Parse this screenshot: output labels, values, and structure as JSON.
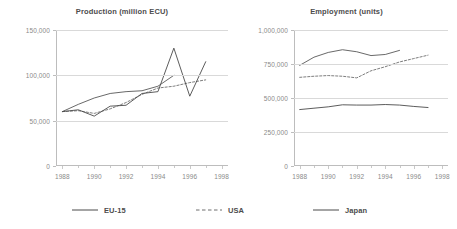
{
  "chart_data": [
    {
      "type": "line",
      "title": "Production (million ECU)",
      "xlabel": "",
      "ylabel": "",
      "x": [
        1988,
        1989,
        1990,
        1991,
        1992,
        1993,
        1994,
        1995,
        1996,
        1997
      ],
      "xlim": [
        1987.6,
        1998.4
      ],
      "ylim": [
        0,
        150000
      ],
      "xticks": [
        1988,
        1990,
        1992,
        1994,
        1996,
        1998
      ],
      "xticklabels": [
        "1988",
        "1990",
        "1992",
        "1994",
        "1996",
        "1998"
      ],
      "yticks": [
        0,
        50000,
        100000,
        150000
      ],
      "yticklabels": [
        "0",
        "50,000",
        "100,000",
        "150,000"
      ],
      "grid": true,
      "legend_position": "bottom",
      "series": [
        {
          "name": "EU-15",
          "style": "solid",
          "color": "#585858",
          "values": [
            60000,
            68000,
            75000,
            80000,
            82000,
            83000,
            88000,
            100000,
            null,
            null
          ]
        },
        {
          "name": "USA",
          "style": "dashed",
          "color": "#6e6e6e",
          "values": [
            60000,
            61000,
            58000,
            63000,
            70000,
            79000,
            86000,
            88000,
            92000,
            95000
          ]
        },
        {
          "name": "Japan",
          "style": "solid",
          "color": "#4a4a4a",
          "values": [
            60000,
            62000,
            55000,
            66000,
            67000,
            80000,
            82000,
            130000,
            77000,
            115000
          ]
        }
      ]
    },
    {
      "type": "line",
      "title": "Employment (units)",
      "xlabel": "",
      "ylabel": "",
      "x": [
        1988,
        1989,
        1990,
        1991,
        1992,
        1993,
        1994,
        1995,
        1996,
        1997
      ],
      "xlim": [
        1987.6,
        1998.4
      ],
      "ylim": [
        0,
        1000000
      ],
      "xticks": [
        1988,
        1990,
        1992,
        1994,
        1996,
        1998
      ],
      "xticklabels": [
        "1988",
        "1990",
        "1992",
        "1994",
        "1996",
        "1998"
      ],
      "yticks": [
        0,
        250000,
        500000,
        750000,
        1000000
      ],
      "yticklabels": [
        "0",
        "250,000",
        "500,000",
        "750,000",
        "1,000,000"
      ],
      "grid": true,
      "legend_position": "bottom",
      "series": [
        {
          "name": "EU-15",
          "style": "solid",
          "color": "#585858",
          "values": [
            740000,
            800000,
            835000,
            855000,
            840000,
            812000,
            820000,
            850000,
            null,
            null
          ]
        },
        {
          "name": "USA",
          "style": "dashed",
          "color": "#6e6e6e",
          "values": [
            652000,
            660000,
            665000,
            660000,
            648000,
            700000,
            730000,
            765000,
            790000,
            815000
          ]
        },
        {
          "name": "Japan",
          "style": "solid",
          "color": "#4a4a4a",
          "values": [
            415000,
            425000,
            435000,
            450000,
            448000,
            448000,
            452000,
            448000,
            438000,
            430000
          ]
        }
      ]
    }
  ],
  "legend": {
    "items": [
      {
        "label": "EU-15",
        "style": "solid"
      },
      {
        "label": "USA",
        "style": "dashed"
      },
      {
        "label": "Japan",
        "style": "solid"
      }
    ]
  }
}
